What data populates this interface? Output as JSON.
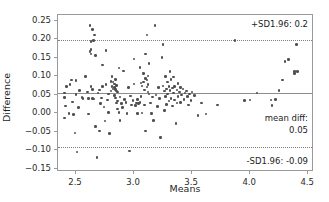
{
  "chart_data": {
    "type": "scatter",
    "title": "",
    "xlabel": "Means",
    "ylabel": "Difference",
    "xlim": [
      2.345,
      4.55
    ],
    "ylim": [
      -0.158,
      0.265
    ],
    "grid": false,
    "legend_position": "none",
    "xticks": [
      2.5,
      3.0,
      3.5,
      4.0,
      4.5
    ],
    "xtick_labels": [
      "2.5",
      "3.0",
      "3.5",
      "4.0",
      "4.5"
    ],
    "yticks": [
      0.25,
      0.2,
      0.15,
      0.1,
      0.05,
      0.0,
      -0.05,
      -0.1,
      -0.15
    ],
    "ytick_labels": [
      "0.25",
      "0.20",
      "0.15",
      "0.10",
      "0.05",
      "0.00",
      "−0.05",
      "−0.10",
      "−0.15"
    ],
    "reference_lines": [
      {
        "name": "upper-limit-of-agreement",
        "value": 0.197,
        "style": "dotted",
        "label": "+SD1.96: 0.2"
      },
      {
        "name": "mean-difference",
        "value": 0.054,
        "style": "solid",
        "label": "mean diff:"
      },
      {
        "name": "lower-limit-of-agreement",
        "value": -0.091,
        "style": "dotted",
        "label": "-SD1.96: -0.09"
      }
    ],
    "annotations": [
      {
        "name": "upper-sd-annotation",
        "text": "+SD1.96: 0.2"
      },
      {
        "name": "mean-diff-annotation",
        "text": "mean diff:"
      },
      {
        "name": "mean-diff-value-annotation",
        "text": "0.05"
      },
      {
        "name": "lower-sd-annotation",
        "text": "-SD1.96: -0.09"
      }
    ],
    "marker_color": "#4f4f4f",
    "line_color": "#8d8d8d",
    "points": [
      [
        2.4,
        0.055
      ],
      [
        2.4,
        -0.012
      ],
      [
        2.4,
        0.042
      ],
      [
        2.41,
        0.02
      ],
      [
        2.42,
        0.072
      ],
      [
        2.44,
        0.0
      ],
      [
        2.45,
        0.078
      ],
      [
        2.46,
        0.09
      ],
      [
        2.47,
        0.031
      ],
      [
        2.48,
        -0.003
      ],
      [
        2.49,
        -0.053
      ],
      [
        2.5,
        0.051
      ],
      [
        2.5,
        0.088
      ],
      [
        2.51,
        -0.104
      ],
      [
        2.52,
        0.016
      ],
      [
        2.53,
        0.061
      ],
      [
        2.55,
        0.042
      ],
      [
        2.56,
        0.04
      ],
      [
        2.58,
        0.1
      ],
      [
        2.6,
        0.057
      ],
      [
        2.61,
        0.04
      ],
      [
        2.61,
        -0.002
      ],
      [
        2.62,
        0.237
      ],
      [
        2.62,
        0.166
      ],
      [
        2.63,
        0.172
      ],
      [
        2.63,
        0.16
      ],
      [
        2.63,
        0.193
      ],
      [
        2.63,
        0.072
      ],
      [
        2.64,
        0.226
      ],
      [
        2.64,
        0.065
      ],
      [
        2.64,
        0.04
      ],
      [
        2.65,
        0.196
      ],
      [
        2.65,
        0.039
      ],
      [
        2.66,
        0.211
      ],
      [
        2.67,
        0.156
      ],
      [
        2.67,
        -0.035
      ],
      [
        2.68,
        -0.119
      ],
      [
        2.69,
        0.055
      ],
      [
        2.7,
        0.063
      ],
      [
        2.7,
        -0.047
      ],
      [
        2.71,
        0.027
      ],
      [
        2.72,
        0.041
      ],
      [
        2.73,
        0.13
      ],
      [
        2.73,
        0.073
      ],
      [
        2.74,
        0.017
      ],
      [
        2.75,
        -0.021
      ],
      [
        2.76,
        0.17
      ],
      [
        2.76,
        0.078
      ],
      [
        2.77,
        0.036
      ],
      [
        2.78,
        0.003
      ],
      [
        2.78,
        0.052
      ],
      [
        2.79,
        -0.054
      ],
      [
        2.8,
        0.086
      ],
      [
        2.8,
        0.06
      ],
      [
        2.81,
        0.1
      ],
      [
        2.81,
        0.072
      ],
      [
        2.82,
        0.085
      ],
      [
        2.82,
        0.066
      ],
      [
        2.83,
        0.079
      ],
      [
        2.83,
        0.07
      ],
      [
        2.83,
        0.048
      ],
      [
        2.84,
        0.092
      ],
      [
        2.84,
        0.064
      ],
      [
        2.84,
        0.041
      ],
      [
        2.85,
        0.075
      ],
      [
        2.85,
        0.06
      ],
      [
        2.85,
        0.028
      ],
      [
        2.86,
        0.057
      ],
      [
        2.86,
        0.033
      ],
      [
        2.86,
        0.012
      ],
      [
        2.87,
        0.122
      ],
      [
        2.87,
        0.002
      ],
      [
        2.88,
        0.044
      ],
      [
        2.88,
        -0.02
      ],
      [
        2.89,
        0.026
      ],
      [
        2.9,
        0.015
      ],
      [
        2.91,
        0.114
      ],
      [
        2.92,
        0.038
      ],
      [
        2.93,
        0.03
      ],
      [
        2.94,
        0.0
      ],
      [
        2.95,
        0.069
      ],
      [
        2.96,
        -0.101
      ],
      [
        2.97,
        0.047
      ],
      [
        2.98,
        0.022
      ],
      [
        2.99,
        0.035
      ],
      [
        3.0,
        0.079
      ],
      [
        3.0,
        0.147
      ],
      [
        3.01,
        0.021
      ],
      [
        3.02,
        0.028
      ],
      [
        3.03,
        0.037
      ],
      [
        3.03,
        0.0
      ],
      [
        3.04,
        0.026
      ],
      [
        3.05,
        0.123
      ],
      [
        3.05,
        0.029
      ],
      [
        3.06,
        0.082
      ],
      [
        3.06,
        0.045
      ],
      [
        3.07,
        0.074
      ],
      [
        3.07,
        0.001
      ],
      [
        3.08,
        0.107
      ],
      [
        3.08,
        0.084
      ],
      [
        3.09,
        0.063
      ],
      [
        3.09,
        0.022
      ],
      [
        3.1,
        0.16
      ],
      [
        3.1,
        0.094
      ],
      [
        3.1,
        -0.048
      ],
      [
        3.11,
        0.211
      ],
      [
        3.11,
        0.09
      ],
      [
        3.11,
        0.071
      ],
      [
        3.12,
        0.101
      ],
      [
        3.12,
        0.078
      ],
      [
        3.12,
        0.057
      ],
      [
        3.13,
        0.135
      ],
      [
        3.13,
        0.052
      ],
      [
        3.14,
        0.028
      ],
      [
        3.15,
        0.0
      ],
      [
        3.16,
        0.044
      ],
      [
        3.17,
        -0.02
      ],
      [
        3.18,
        0.236
      ],
      [
        3.19,
        0.05
      ],
      [
        3.2,
        0.018
      ],
      [
        3.21,
        0.07
      ],
      [
        3.22,
        0.04
      ],
      [
        3.23,
        -0.065
      ],
      [
        3.24,
        0.15
      ],
      [
        3.25,
        0.185
      ],
      [
        3.25,
        0.074
      ],
      [
        3.26,
        0.06
      ],
      [
        3.26,
        0.008
      ],
      [
        3.27,
        0.1
      ],
      [
        3.27,
        0.045
      ],
      [
        3.28,
        0.066
      ],
      [
        3.28,
        0.024
      ],
      [
        3.29,
        0.085
      ],
      [
        3.29,
        0.052
      ],
      [
        3.3,
        0.073
      ],
      [
        3.3,
        0.033
      ],
      [
        3.31,
        0.112
      ],
      [
        3.31,
        0.061
      ],
      [
        3.32,
        0.091
      ],
      [
        3.32,
        0.04
      ],
      [
        3.33,
        0.068
      ],
      [
        3.33,
        0.02
      ],
      [
        3.34,
        0.098
      ],
      [
        3.34,
        0.055
      ],
      [
        3.35,
        0.072
      ],
      [
        3.35,
        0.036
      ],
      [
        3.36,
        -0.027
      ],
      [
        3.37,
        0.063
      ],
      [
        3.37,
        0.028
      ],
      [
        3.38,
        0.08
      ],
      [
        3.38,
        0.046
      ],
      [
        3.39,
        0.058
      ],
      [
        3.4,
        0.07
      ],
      [
        3.4,
        0.03
      ],
      [
        3.41,
        0.05
      ],
      [
        3.42,
        0.066
      ],
      [
        3.43,
        0.038
      ],
      [
        3.44,
        0.055
      ],
      [
        3.45,
        0.06
      ],
      [
        3.46,
        0.045
      ],
      [
        3.47,
        0.022
      ],
      [
        3.48,
        0.052
      ],
      [
        3.49,
        0.035
      ],
      [
        3.5,
        0.058
      ],
      [
        3.52,
        0.048
      ],
      [
        3.55,
        -0.005
      ],
      [
        3.58,
        0.028
      ],
      [
        3.62,
        -0.002
      ],
      [
        3.72,
        0.022
      ],
      [
        3.86,
        -0.16
      ],
      [
        3.87,
        0.196
      ],
      [
        3.95,
        0.035
      ],
      [
        4.0,
        0.036
      ],
      [
        4.06,
        0.055
      ],
      [
        4.18,
        0.036
      ],
      [
        4.19,
        0.021
      ],
      [
        4.22,
        0.037
      ],
      [
        4.25,
        0.062
      ],
      [
        4.28,
        0.09
      ],
      [
        4.3,
        0.14
      ],
      [
        4.33,
        0.145
      ],
      [
        4.38,
        0.113
      ],
      [
        4.38,
        0.108
      ],
      [
        4.4,
        0.185
      ],
      [
        4.41,
        0.112
      ]
    ]
  }
}
